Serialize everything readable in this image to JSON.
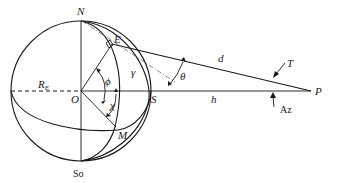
{
  "diagram": {
    "type": "geometry",
    "labels": {
      "north": "N",
      "south_pole": "So",
      "earth_point": "E",
      "center": "O",
      "subpoint": "S",
      "point_m": "M",
      "radius": "R",
      "radius_sub": "E",
      "phi": "ϕ",
      "chi": "χ",
      "gamma": "γ",
      "theta": "θ",
      "distance": "d",
      "altitude": "h",
      "tilt": "T",
      "azimuth": "Az",
      "satellite": "P"
    },
    "colors": {
      "line": "#1a1a1a",
      "background": "#ffffff"
    }
  }
}
